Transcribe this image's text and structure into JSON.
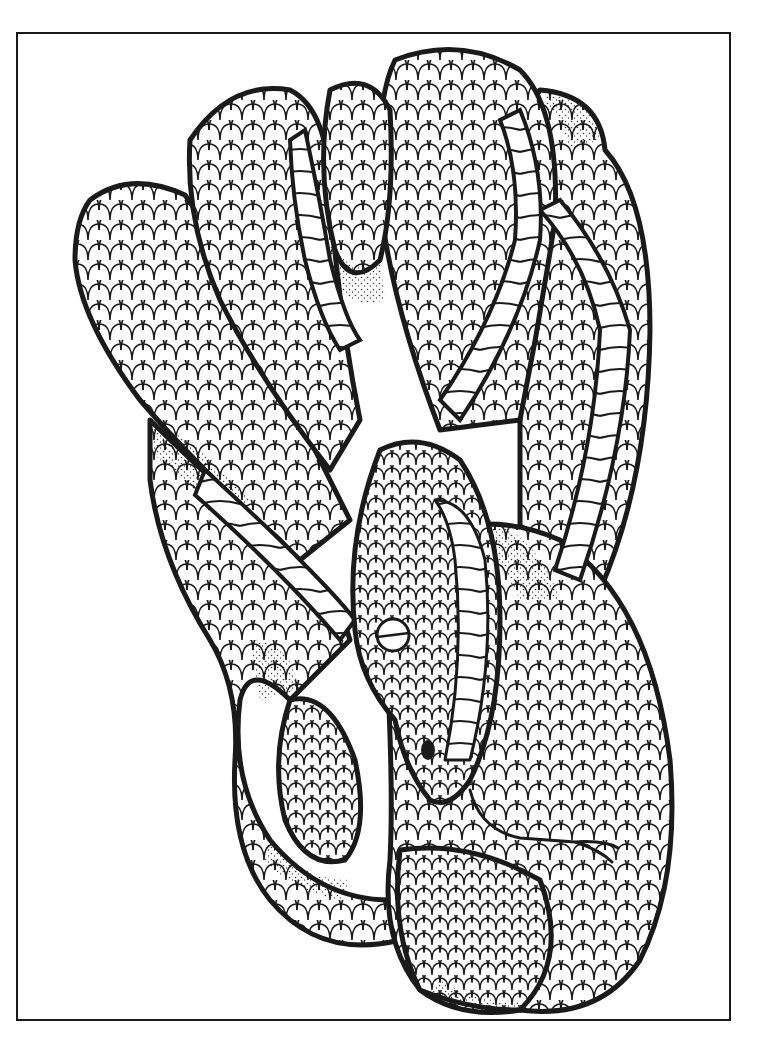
{
  "page": {
    "type": "coloring-page",
    "background_color": "#ffffff",
    "ink_color": "#1a1a1a"
  },
  "frame": {
    "x": 17,
    "y": 33,
    "width": 713,
    "height": 987,
    "stroke_width": 2
  },
  "illustration": {
    "elements": [
      "coiled-snake-body",
      "belly-scale-bands",
      "snake-head",
      "snake-eye",
      "forked-tongue",
      "stippled-shading"
    ]
  }
}
